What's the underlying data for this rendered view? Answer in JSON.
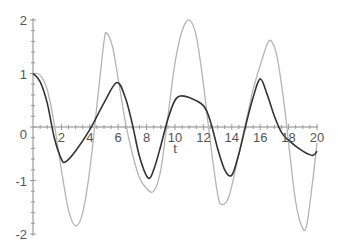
{
  "chart_data": {
    "type": "line",
    "title": "",
    "xlabel": "t",
    "ylabel": "",
    "xlim": [
      0,
      20
    ],
    "ylim": [
      -2,
      2
    ],
    "grid": false,
    "legend": null,
    "x_ticks": [
      2,
      4,
      6,
      8,
      10,
      12,
      14,
      16,
      18,
      20
    ],
    "x_tick_labels": [
      "2",
      "4",
      "6",
      "8",
      "10",
      "12",
      "14",
      "16",
      "18",
      "20"
    ],
    "y_ticks": [
      -2,
      -1,
      0,
      1,
      2
    ],
    "y_tick_labels": [
      "-2",
      "-1",
      "0",
      "1",
      "2"
    ],
    "series": [
      {
        "name": "light curve",
        "color": "#b4b4b4",
        "width": 1.3,
        "points": [
          [
            0,
            1
          ],
          [
            0.5,
            0.97
          ],
          [
            1,
            0.7
          ],
          [
            1.5,
            0.05
          ],
          [
            2,
            -0.8
          ],
          [
            2.5,
            -1.55
          ],
          [
            3,
            -1.85
          ],
          [
            3.5,
            -1.6
          ],
          [
            4,
            -0.8
          ],
          [
            4.5,
            0.4
          ],
          [
            5,
            1.6
          ],
          [
            5.2,
            1.75
          ],
          [
            5.6,
            1.5
          ],
          [
            6,
            0.9
          ],
          [
            6.5,
            0.1
          ],
          [
            7,
            -0.5
          ],
          [
            7.5,
            -0.95
          ],
          [
            8,
            -1.15
          ],
          [
            8.5,
            -1.2
          ],
          [
            9,
            -0.8
          ],
          [
            9.5,
            0.2
          ],
          [
            10,
            1.2
          ],
          [
            10.5,
            1.8
          ],
          [
            11,
            2.0
          ],
          [
            11.5,
            1.7
          ],
          [
            12,
            0.8
          ],
          [
            12.5,
            -0.3
          ],
          [
            13,
            -1.25
          ],
          [
            13.3,
            -1.45
          ],
          [
            13.8,
            -1.3
          ],
          [
            14.5,
            -0.5
          ],
          [
            15,
            0.1
          ],
          [
            15.5,
            0.7
          ],
          [
            16,
            1.15
          ],
          [
            16.5,
            1.55
          ],
          [
            16.8,
            1.6
          ],
          [
            17.2,
            1.3
          ],
          [
            17.7,
            0.4
          ],
          [
            18,
            -0.3
          ],
          [
            18.5,
            -1.4
          ],
          [
            19,
            -1.9
          ],
          [
            19.3,
            -1.8
          ],
          [
            19.7,
            -1.0
          ],
          [
            20,
            -0.3
          ]
        ]
      },
      {
        "name": "dark curve",
        "color": "#333333",
        "width": 1.6,
        "points": [
          [
            0,
            1
          ],
          [
            0.5,
            0.85
          ],
          [
            1,
            0.45
          ],
          [
            1.5,
            -0.2
          ],
          [
            2,
            -0.6
          ],
          [
            2.3,
            -0.65
          ],
          [
            3,
            -0.45
          ],
          [
            4,
            -0.05
          ],
          [
            5,
            0.45
          ],
          [
            5.9,
            0.83
          ],
          [
            6.5,
            0.55
          ],
          [
            7,
            0.05
          ],
          [
            7.5,
            -0.55
          ],
          [
            8.1,
            -0.95
          ],
          [
            8.5,
            -0.8
          ],
          [
            9,
            -0.35
          ],
          [
            9.5,
            0.15
          ],
          [
            10,
            0.5
          ],
          [
            10.4,
            0.58
          ],
          [
            11,
            0.55
          ],
          [
            12,
            0.4
          ],
          [
            12.5,
            0.1
          ],
          [
            13,
            -0.4
          ],
          [
            13.5,
            -0.8
          ],
          [
            14,
            -0.9
          ],
          [
            14.5,
            -0.5
          ],
          [
            15,
            0.05
          ],
          [
            15.5,
            0.55
          ],
          [
            16,
            0.9
          ],
          [
            16.5,
            0.6
          ],
          [
            17,
            0.2
          ],
          [
            17.5,
            -0.1
          ],
          [
            18,
            -0.25
          ],
          [
            19,
            -0.45
          ],
          [
            19.7,
            -0.53
          ],
          [
            20,
            -0.45
          ]
        ]
      }
    ]
  }
}
